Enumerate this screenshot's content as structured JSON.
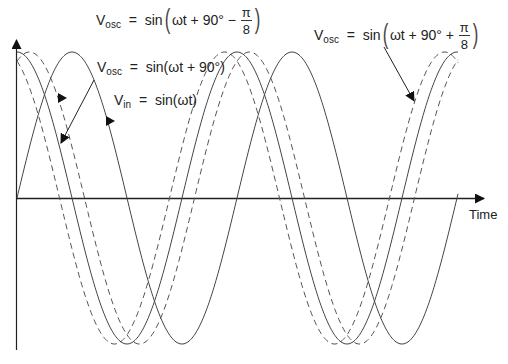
{
  "diagram": {
    "type": "phase-shifted sine waveforms",
    "x_axis_label": "Time",
    "labels": {
      "vosc_minus": {
        "lhs_main": "V",
        "lhs_sub": "osc",
        "eq": "=",
        "fn": "sin",
        "inner": "ωt + 90° −",
        "frac_num": "π",
        "frac_den": "8"
      },
      "vosc": {
        "lhs_main": "V",
        "lhs_sub": "osc",
        "eq": "=",
        "rhs": "sin(ωt + 90°)"
      },
      "vin": {
        "lhs_main": "V",
        "lhs_sub": "in",
        "eq": "=",
        "rhs": "sin(ωt)"
      },
      "vosc_plus": {
        "lhs_main": "V",
        "lhs_sub": "osc",
        "eq": "=",
        "fn": "sin",
        "inner": "ωt + 90° +",
        "frac_num": "π",
        "frac_den": "8"
      }
    },
    "curves": [
      {
        "name": "Vin = sin(ωt)",
        "style": "solid",
        "phase": "0"
      },
      {
        "name": "Vosc = sin(ωt + 90°)",
        "style": "solid",
        "phase": "90°"
      },
      {
        "name": "Vosc = sin(ωt + 90° − π/8)",
        "style": "dashed",
        "phase": "90° − π/8"
      },
      {
        "name": "Vosc = sin(ωt + 90° + π/8)",
        "style": "dashed",
        "phase": "90° + π/8"
      }
    ],
    "geometry": {
      "x_start": 17,
      "x_end": 458,
      "center_y": 198,
      "amplitude": 146,
      "period": 220,
      "dash_shift": 12.5
    },
    "colors": {
      "curve": "#444444",
      "axis": "#222222",
      "text": "#222222"
    }
  }
}
